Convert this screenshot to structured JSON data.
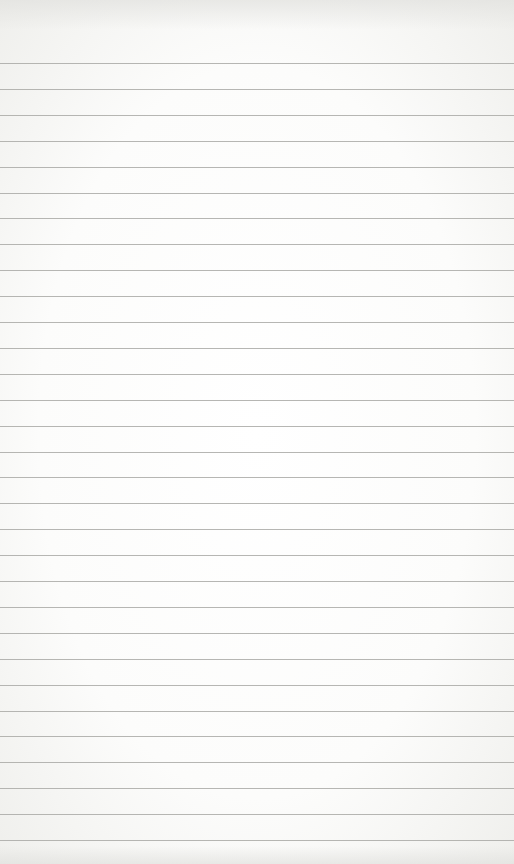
{
  "page": {
    "type": "lined-paper",
    "background_color": "#fdfdfc",
    "rule_color": "#a9a9a6",
    "rule_count": 31,
    "first_rule_y": 63,
    "rule_spacing": 25.9
  }
}
